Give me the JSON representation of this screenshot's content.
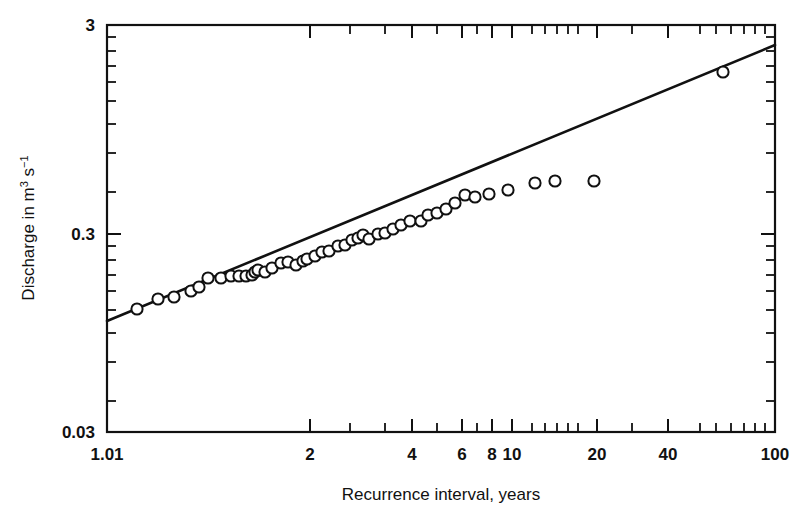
{
  "chart_data": {
    "type": "scatter",
    "title": "",
    "xlabel": "Recurrence interval, years",
    "ylabel": "Discharge in m",
    "ylabel_sup1": "3",
    "ylabel_mid": " s",
    "ylabel_sup2": "−1",
    "ylabel_full": "Discharge in m3 s-1",
    "x_scale": "gumbel-log",
    "y_scale": "log",
    "xlim": [
      1.01,
      100
    ],
    "ylim": [
      0.03,
      3
    ],
    "grid": false,
    "legend": null,
    "x_tick_labels": [
      "1.01",
      "2",
      "4",
      "6",
      "8",
      "10",
      "20",
      "40",
      "100"
    ],
    "x_tick_values": [
      1.01,
      2,
      4,
      6,
      8,
      10,
      20,
      40,
      100
    ],
    "x_tick_px": [
      107,
      310,
      412,
      462,
      492,
      512,
      597,
      668,
      775
    ],
    "x_minor_px": [
      350,
      385,
      437,
      477,
      532,
      545,
      557,
      568,
      578,
      632,
      700,
      716,
      731,
      744,
      755,
      765
    ],
    "y_tick_labels": [
      "3",
      "0.3",
      "0.03"
    ],
    "y_tick_values": [
      3,
      0.3,
      0.03
    ],
    "y_tick_px": [
      25,
      234,
      432
    ],
    "y_minor_px": [
      37,
      51,
      66,
      82,
      101,
      124,
      153,
      192,
      246,
      260,
      275,
      291,
      310,
      333,
      362,
      401
    ],
    "marker_style": "open-circle",
    "marker_radius_px": 5.6,
    "series": [
      {
        "name": "Annual peak discharge",
        "points_px": [
          [
            137,
            309
          ],
          [
            158,
            299
          ],
          [
            174,
            297
          ],
          [
            191,
            291
          ],
          [
            199,
            287
          ],
          [
            208,
            278
          ],
          [
            221,
            278
          ],
          [
            231,
            276
          ],
          [
            239,
            276
          ],
          [
            246,
            276
          ],
          [
            252,
            275
          ],
          [
            255,
            272
          ],
          [
            258,
            270
          ],
          [
            265,
            272
          ],
          [
            272,
            268
          ],
          [
            281,
            263
          ],
          [
            288,
            262
          ],
          [
            296,
            265
          ],
          [
            303,
            261
          ],
          [
            307,
            259
          ],
          [
            315,
            256
          ],
          [
            322,
            252
          ],
          [
            329,
            251
          ],
          [
            338,
            246
          ],
          [
            345,
            245
          ],
          [
            352,
            240
          ],
          [
            358,
            238
          ],
          [
            363,
            235
          ],
          [
            369,
            239
          ],
          [
            378,
            234
          ],
          [
            385,
            233
          ],
          [
            393,
            229
          ],
          [
            401,
            225
          ],
          [
            410,
            221
          ],
          [
            421,
            221
          ],
          [
            428,
            215
          ],
          [
            437,
            213
          ],
          [
            446,
            209
          ],
          [
            455,
            203
          ],
          [
            465,
            195
          ],
          [
            475,
            197
          ],
          [
            489,
            194
          ],
          [
            508,
            190
          ],
          [
            535,
            183
          ],
          [
            555,
            181
          ],
          [
            594,
            181
          ],
          [
            723,
            72
          ]
        ],
        "values": [
          {
            "x": 1.04,
            "y": 0.165
          },
          {
            "x": 1.08,
            "y": 0.182
          },
          {
            "x": 1.12,
            "y": 0.186
          },
          {
            "x": 1.16,
            "y": 0.197
          },
          {
            "x": 1.18,
            "y": 0.205
          },
          {
            "x": 1.21,
            "y": 0.224
          },
          {
            "x": 1.25,
            "y": 0.224
          },
          {
            "x": 1.28,
            "y": 0.229
          },
          {
            "x": 1.31,
            "y": 0.229
          },
          {
            "x": 1.34,
            "y": 0.229
          },
          {
            "x": 1.36,
            "y": 0.231
          },
          {
            "x": 1.37,
            "y": 0.238
          },
          {
            "x": 1.39,
            "y": 0.243
          },
          {
            "x": 1.41,
            "y": 0.238
          },
          {
            "x": 1.45,
            "y": 0.247
          },
          {
            "x": 1.49,
            "y": 0.259
          },
          {
            "x": 1.52,
            "y": 0.262
          },
          {
            "x": 1.57,
            "y": 0.255
          },
          {
            "x": 1.61,
            "y": 0.265
          },
          {
            "x": 1.63,
            "y": 0.27
          },
          {
            "x": 1.68,
            "y": 0.278
          },
          {
            "x": 1.73,
            "y": 0.288
          },
          {
            "x": 1.78,
            "y": 0.291
          },
          {
            "x": 1.85,
            "y": 0.305
          },
          {
            "x": 1.9,
            "y": 0.308
          },
          {
            "x": 1.96,
            "y": 0.322
          },
          {
            "x": 2.02,
            "y": 0.328
          },
          {
            "x": 2.07,
            "y": 0.338
          },
          {
            "x": 2.12,
            "y": 0.325
          },
          {
            "x": 2.21,
            "y": 0.341
          },
          {
            "x": 2.28,
            "y": 0.344
          },
          {
            "x": 2.37,
            "y": 0.357
          },
          {
            "x": 2.47,
            "y": 0.371
          },
          {
            "x": 2.59,
            "y": 0.386
          },
          {
            "x": 2.75,
            "y": 0.386
          },
          {
            "x": 2.85,
            "y": 0.41
          },
          {
            "x": 3.0,
            "y": 0.418
          },
          {
            "x": 3.17,
            "y": 0.434
          },
          {
            "x": 3.36,
            "y": 0.459
          },
          {
            "x": 3.59,
            "y": 0.496
          },
          {
            "x": 3.85,
            "y": 0.486
          },
          {
            "x": 4.25,
            "y": 0.5
          },
          {
            "x": 4.9,
            "y": 0.519
          },
          {
            "x": 6.1,
            "y": 0.556
          },
          {
            "x": 7.4,
            "y": 0.568
          },
          {
            "x": 11.5,
            "y": 0.568
          },
          {
            "x": 62,
            "y": 1.82
          }
        ]
      }
    ],
    "fit_line": {
      "name": "Fitted frequency curve",
      "style": "solid",
      "px": [
        [
          107,
          321
        ],
        [
          775,
          45
        ]
      ],
      "endpoints": [
        {
          "x": 1.01,
          "y": 0.148
        },
        {
          "x": 100,
          "y": 2.34
        }
      ]
    }
  },
  "axes": {
    "frame_px": {
      "left": 107,
      "top": 25,
      "right": 775,
      "bottom": 432
    }
  },
  "colors": {
    "ink": "#111111",
    "background": "#ffffff",
    "marker_fill": "#ffffff"
  }
}
